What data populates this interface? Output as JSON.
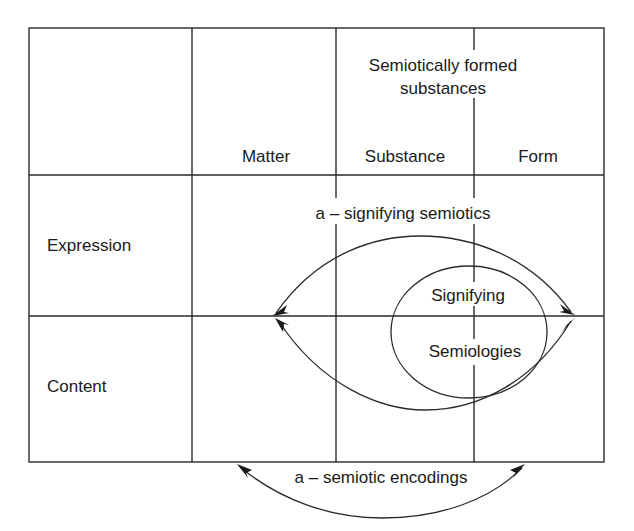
{
  "diagram": {
    "header": {
      "group_label_line1": "Semiotically formed",
      "group_label_line2": "substances",
      "columns": [
        "Matter",
        "Substance",
        "Form"
      ]
    },
    "rows": [
      "Expression",
      "Content"
    ],
    "arcs": {
      "signifying_semiotics": "a – signifying semiotics",
      "semiotic_encodings": "a – semiotic encodings"
    },
    "ellipse": {
      "line1": "Signifying",
      "line2": "Semiologies"
    },
    "colors": {
      "line": "#2a2a2a",
      "text": "#1a1a1a",
      "background": "#ffffff"
    }
  }
}
